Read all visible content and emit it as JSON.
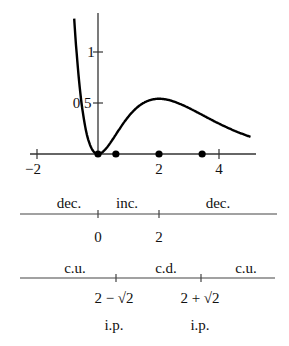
{
  "chart_data": {
    "type": "line",
    "function": "y = x^2 e^(-x)",
    "x": [
      -0.85,
      -0.6,
      -0.4,
      -0.2,
      0,
      0.25,
      0.5,
      0.75,
      1,
      1.5,
      2,
      2.5,
      3,
      3.5,
      4,
      4.5,
      5
    ],
    "y": [
      1.15,
      0.66,
      0.24,
      0.049,
      0,
      0.049,
      0.152,
      0.266,
      0.368,
      0.502,
      0.541,
      0.513,
      0.448,
      0.377,
      0.293,
      0.225,
      0.168
    ],
    "xlim": [
      -2,
      5
    ],
    "ylim": [
      0,
      1.4
    ],
    "x_ticks": [
      {
        "value": -2,
        "label": "−2"
      },
      {
        "value": 2,
        "label": "2"
      },
      {
        "value": 4,
        "label": "4"
      }
    ],
    "y_ticks": [
      {
        "value": 0.5,
        "label": "0.5"
      },
      {
        "value": 1,
        "label": "1"
      }
    ],
    "marked_points": [
      0,
      0.586,
      2,
      3.414
    ],
    "title": "",
    "xlabel": "",
    "ylabel": "",
    "grid": false
  },
  "sign_chart_first_derivative": {
    "intervals": [
      "dec.",
      "inc.",
      "dec."
    ],
    "points": [
      "0",
      "2"
    ]
  },
  "sign_chart_second_derivative": {
    "intervals": [
      "c.u.",
      "c.d.",
      "c.u."
    ],
    "points": [
      "2 − √2",
      "2 + √2"
    ],
    "point_notes": [
      "i.p.",
      "i.p."
    ]
  }
}
